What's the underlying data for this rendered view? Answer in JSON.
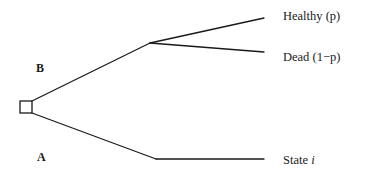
{
  "diagram": {
    "type": "decision-tree",
    "colors": {
      "line": "#1a1a1a",
      "background": "#ffffff"
    },
    "decision_node": {
      "shape": "square",
      "x": 20,
      "y": 101,
      "size": 12
    },
    "branches": [
      {
        "label": "B",
        "label_pos": {
          "x": 36,
          "y": 62
        },
        "from": {
          "x": 32,
          "y": 101
        },
        "to": {
          "x": 150,
          "y": 43
        },
        "outcomes": [
          {
            "label": "Healthy (p)",
            "end": {
              "x": 264,
              "y": 18
            },
            "label_pos": {
              "x": 283,
              "y": 10
            }
          },
          {
            "label": "Dead (1−p)",
            "end": {
              "x": 264,
              "y": 52
            },
            "label_pos": {
              "x": 283,
              "y": 51
            }
          }
        ]
      },
      {
        "label": "A",
        "label_pos": {
          "x": 37,
          "y": 151
        },
        "from": {
          "x": 32,
          "y": 113
        },
        "to": {
          "x": 156,
          "y": 159
        },
        "outcomes": [
          {
            "label_prefix": "State ",
            "label_var": "i",
            "end": {
              "x": 264,
              "y": 159
            },
            "label_pos": {
              "x": 283,
              "y": 154
            }
          }
        ]
      }
    ]
  }
}
